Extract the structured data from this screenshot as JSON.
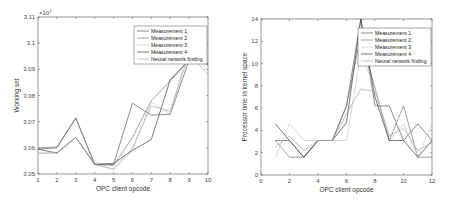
{
  "chart_data": [
    {
      "type": "line",
      "title": "",
      "xlabel": "OPC client opcode",
      "ylabel": "Working set",
      "y_exponent_label": "×10^7",
      "xlim": [
        1,
        10
      ],
      "ylim": [
        3.05,
        3.11
      ],
      "xticks": [
        1,
        2,
        3,
        4,
        5,
        6,
        7,
        8,
        9,
        10
      ],
      "yticks": [
        3.05,
        3.06,
        3.07,
        3.08,
        3.09,
        3.1,
        3.11
      ],
      "ytick_labels": [
        "3.05",
        "3.06",
        "3.07",
        "3.08",
        "3.09",
        "3.1",
        "3.11"
      ],
      "grid": false,
      "legend_position": "upper right",
      "x": [
        1,
        2,
        3,
        4,
        5,
        6,
        7,
        8,
        9,
        10
      ],
      "series": [
        {
          "name": "Measurement 1",
          "color": "#5a5a5a",
          "values": [
            3.0595,
            3.06,
            3.0713,
            3.0537,
            3.0537,
            3.077,
            3.0725,
            3.0728,
            3.0935,
            3.092
          ]
        },
        {
          "name": "Measurement 2",
          "color": "#7a7a7a",
          "values": [
            3.06,
            3.0603,
            3.0715,
            3.0537,
            3.0532,
            3.064,
            3.078,
            3.0855,
            3.0935,
            3.092
          ]
        },
        {
          "name": "Measurement 3",
          "color": "#c8c8c8",
          "values": [
            3.058,
            3.058,
            3.064,
            3.054,
            3.0515,
            3.059,
            3.0775,
            3.073,
            3.099,
            3.089
          ]
        },
        {
          "name": "Measurement 4",
          "color": "#404040",
          "values": [
            3.0595,
            3.058,
            3.064,
            3.0537,
            3.054,
            3.059,
            3.0632,
            3.086,
            3.0935,
            3.092
          ]
        },
        {
          "name": "Neural network finding",
          "color": "#a8a8a8",
          "values": [
            3.0578,
            3.0582,
            3.064,
            3.0535,
            3.052,
            3.06,
            3.076,
            3.074,
            3.096,
            3.088
          ]
        }
      ]
    },
    {
      "type": "line",
      "title": "",
      "xlabel": "OPC client opcode",
      "ylabel": "Processor time in kernel space",
      "xlim": [
        0,
        12
      ],
      "ylim": [
        0,
        14
      ],
      "xticks": [
        0,
        2,
        4,
        6,
        8,
        10,
        12
      ],
      "yticks": [
        0,
        2,
        4,
        6,
        8,
        10,
        12,
        14
      ],
      "grid": false,
      "legend_position": "upper right",
      "x": [
        1,
        2,
        3,
        4,
        5,
        6,
        7,
        8,
        9,
        10,
        11,
        12
      ],
      "series": [
        {
          "name": "Measurement 1",
          "color": "#5a5a5a",
          "values": [
            3.1,
            3.1,
            1.6,
            3.1,
            3.1,
            6.2,
            14.0,
            6.2,
            6.2,
            3.1,
            4.6,
            3.1
          ]
        },
        {
          "name": "Measurement 2",
          "color": "#7a7a7a",
          "values": [
            3.1,
            1.6,
            1.6,
            3.1,
            3.1,
            6.2,
            12.5,
            7.8,
            3.1,
            6.2,
            1.6,
            1.6
          ]
        },
        {
          "name": "Measurement 3",
          "color": "#c8c8c8",
          "values": [
            1.6,
            4.6,
            3.1,
            3.1,
            3.1,
            3.1,
            10.9,
            7.8,
            3.1,
            4.6,
            1.6,
            4.6
          ]
        },
        {
          "name": "Measurement 4",
          "color": "#404040",
          "values": [
            4.6,
            3.1,
            1.6,
            3.1,
            3.1,
            4.7,
            14.0,
            7.0,
            3.1,
            3.1,
            1.6,
            3.1
          ]
        },
        {
          "name": "Neural network finding",
          "color": "#a8a8a8",
          "values": [
            2.5,
            3.5,
            2.2,
            3.1,
            3.1,
            5.5,
            7.7,
            7.5,
            3.5,
            4.2,
            2.2,
            2.9
          ]
        }
      ]
    }
  ]
}
